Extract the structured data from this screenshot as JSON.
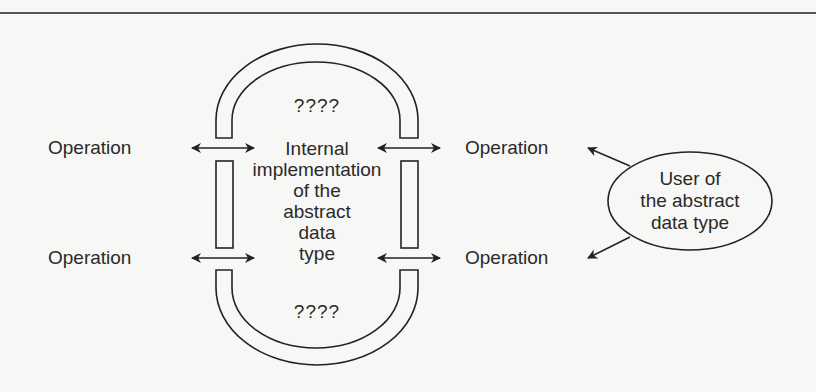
{
  "diagram": {
    "title": "",
    "operations": {
      "left_top": "Operation",
      "left_bottom": "Operation",
      "right_top": "Operation",
      "right_bottom": "Operation"
    },
    "top_unknown": "????",
    "bottom_unknown": "????",
    "internal_implementation": {
      "lines": [
        "Internal",
        "implementation",
        "of the",
        "abstract",
        "data",
        "type"
      ]
    },
    "user": {
      "lines": [
        "User of",
        "the abstract",
        "data type"
      ]
    },
    "colors": {
      "stroke": "#222222",
      "background": "#f7f7f5"
    }
  }
}
